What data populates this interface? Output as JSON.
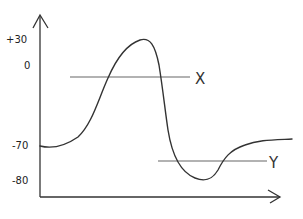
{
  "diagram": {
    "type": "hand-drawn action potential style graph",
    "y_axis": {
      "ticks": [
        {
          "label": "+30",
          "y": 43
        },
        {
          "label": "0",
          "y": 69
        },
        {
          "label": "-70",
          "y": 149
        },
        {
          "label": "-80",
          "y": 184
        }
      ]
    },
    "threshold_lines": [
      {
        "label": "X"
      },
      {
        "label": "Y"
      }
    ],
    "colors": {
      "curve": "#333333",
      "axes": "#333333",
      "threshold": "#666666",
      "background": "#ffffff"
    }
  }
}
